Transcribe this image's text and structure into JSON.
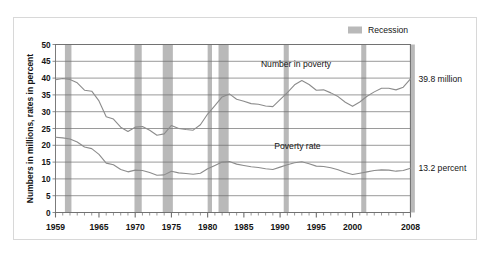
{
  "chart_data": {
    "type": "line",
    "title": "",
    "xlabel": "",
    "ylabel": "Numbers in millions, rates in percent",
    "xlim": [
      1959,
      2008
    ],
    "ylim": [
      0,
      50
    ],
    "grid": true,
    "legend_position": "top-right",
    "x_tick_labels": [
      "1959",
      "1965",
      "1970",
      "1975",
      "1980",
      "1985",
      "1990",
      "1995",
      "2000",
      "2008"
    ],
    "x_tick_values": [
      1959,
      1965,
      1970,
      1975,
      1980,
      1985,
      1990,
      1995,
      2000,
      2008
    ],
    "y_tick_labels": [
      "0",
      "5",
      "10",
      "15",
      "20",
      "25",
      "30",
      "35",
      "40",
      "45",
      "50"
    ],
    "y_tick_values": [
      0,
      5,
      10,
      15,
      20,
      25,
      30,
      35,
      40,
      45,
      50
    ],
    "x": [
      1959,
      1960,
      1961,
      1962,
      1963,
      1964,
      1965,
      1966,
      1967,
      1968,
      1969,
      1970,
      1971,
      1972,
      1973,
      1974,
      1975,
      1976,
      1977,
      1978,
      1979,
      1980,
      1981,
      1982,
      1983,
      1984,
      1985,
      1986,
      1987,
      1988,
      1989,
      1990,
      1991,
      1992,
      1993,
      1994,
      1995,
      1996,
      1997,
      1998,
      1999,
      2000,
      2001,
      2002,
      2003,
      2004,
      2005,
      2006,
      2007,
      2008
    ],
    "series": [
      {
        "name": "Number in poverty",
        "unit": "millions",
        "color": "#8c8c8c",
        "values": [
          39.5,
          39.9,
          39.6,
          38.6,
          36.4,
          36.1,
          33.2,
          28.5,
          27.8,
          25.4,
          24.1,
          25.4,
          25.6,
          24.5,
          23.0,
          23.4,
          25.9,
          25.0,
          24.7,
          24.5,
          26.1,
          29.3,
          31.8,
          34.4,
          35.3,
          33.7,
          33.1,
          32.4,
          32.2,
          31.7,
          31.5,
          33.6,
          35.7,
          38.0,
          39.3,
          38.1,
          36.4,
          36.5,
          35.6,
          34.5,
          32.8,
          31.6,
          32.9,
          34.6,
          35.9,
          37.0,
          37.0,
          36.5,
          37.3,
          39.8
        ]
      },
      {
        "name": "Poverty rate",
        "unit": "percent",
        "color": "#8c8c8c",
        "values": [
          22.4,
          22.2,
          21.9,
          21.0,
          19.5,
          19.0,
          17.3,
          14.7,
          14.2,
          12.8,
          12.1,
          12.6,
          12.5,
          11.9,
          11.1,
          11.2,
          12.3,
          11.8,
          11.6,
          11.4,
          11.7,
          13.0,
          14.0,
          15.0,
          15.2,
          14.4,
          14.0,
          13.6,
          13.4,
          13.0,
          12.8,
          13.5,
          14.2,
          14.8,
          15.1,
          14.5,
          13.8,
          13.7,
          13.3,
          12.7,
          11.9,
          11.3,
          11.7,
          12.1,
          12.5,
          12.7,
          12.6,
          12.3,
          12.5,
          13.2
        ]
      }
    ],
    "recession_bands": [
      {
        "start": 1960.3,
        "end": 1961.2
      },
      {
        "start": 1969.9,
        "end": 1970.9
      },
      {
        "start": 1973.8,
        "end": 1975.2
      },
      {
        "start": 1980.0,
        "end": 1980.6
      },
      {
        "start": 1981.5,
        "end": 1982.9
      },
      {
        "start": 1990.5,
        "end": 1991.2
      },
      {
        "start": 2001.2,
        "end": 2001.9
      },
      {
        "start": 2007.9,
        "end": 2008.6
      }
    ],
    "recession_color": "#b9b9b9",
    "series_inline_labels": [
      {
        "text": "Number in poverty",
        "x": 1992.2,
        "y": 43.2
      },
      {
        "text": "Poverty rate",
        "x": 1992.4,
        "y": 19.0
      }
    ],
    "end_annotations": [
      {
        "text": "39.8 million",
        "value": 39.8,
        "series": "Number in poverty"
      },
      {
        "text": "13.2 percent",
        "value": 13.2,
        "series": "Poverty rate"
      }
    ],
    "legend": [
      {
        "label": "Recession",
        "color": "#b9b9b9",
        "swatch": "recession-swatch"
      }
    ]
  }
}
